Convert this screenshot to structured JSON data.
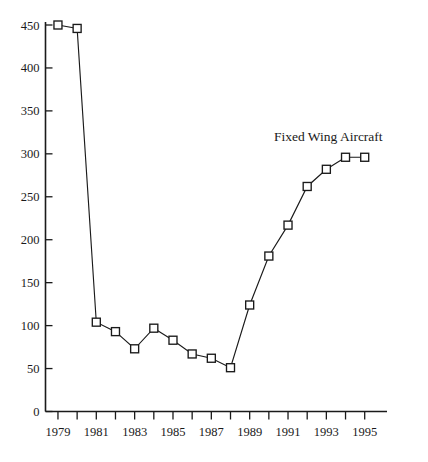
{
  "chart_data": {
    "type": "line",
    "title": "",
    "subtitle": "",
    "xlabel": "",
    "ylabel": "",
    "xlim": [
      1978.5,
      1995.5
    ],
    "ylim": [
      0,
      460
    ],
    "yticks": [
      0,
      50,
      100,
      150,
      200,
      250,
      300,
      350,
      400,
      450
    ],
    "ytick_labels": [
      "0",
      "50",
      "100",
      "150",
      "200",
      "250",
      "300",
      "350",
      "400",
      "450"
    ],
    "xticks": [
      1979,
      1980,
      1981,
      1982,
      1983,
      1984,
      1985,
      1986,
      1987,
      1988,
      1989,
      1990,
      1991,
      1992,
      1993,
      1994,
      1995
    ],
    "xtick_labels_shown": [
      "1979",
      "1981",
      "1983",
      "1985",
      "1987",
      "1989",
      "1991",
      "1993",
      "1995"
    ],
    "grid": false,
    "legend_position": "inline-annotation",
    "marker": "open-square",
    "line_color": "#1a1a1a",
    "marker_fill": "#ffffff",
    "annotation": "Fixed Wing Aircraft",
    "x": [
      1979,
      1980,
      1981,
      1982,
      1983,
      1984,
      1985,
      1986,
      1987,
      1988,
      1989,
      1990,
      1991,
      1992,
      1993,
      1994,
      1995
    ],
    "series": [
      {
        "name": "Fixed Wing Aircraft",
        "values": [
          450,
          446,
          104,
          93,
          73,
          97,
          83,
          67,
          62,
          51,
          124,
          181,
          217,
          262,
          282,
          296,
          296
        ]
      }
    ]
  },
  "annotations": {
    "series_label": "Fixed Wing Aircraft"
  }
}
